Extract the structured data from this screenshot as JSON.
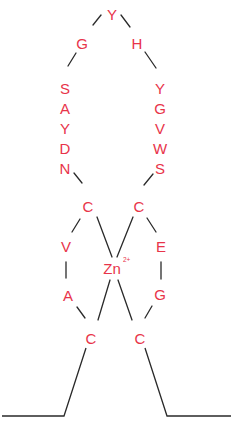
{
  "diagram": {
    "colors": {
      "residue": "#e8344a",
      "line": "#2a2a2a",
      "background": "#ffffff"
    },
    "ion": {
      "label": "Zn",
      "charge": "2+"
    },
    "residues": {
      "top": "Y",
      "g_top": "G",
      "h_top": "H",
      "left_column": [
        "S",
        "A",
        "Y",
        "D",
        "N"
      ],
      "right_column": [
        "Y",
        "G",
        "V",
        "W",
        "S"
      ],
      "c1": "C",
      "c2": "C",
      "v": "V",
      "e": "E",
      "a": "A",
      "g_low": "G",
      "c3": "C",
      "c4": "C"
    },
    "sequence": "CVADNYSAGYHYGVWSCEGC"
  }
}
